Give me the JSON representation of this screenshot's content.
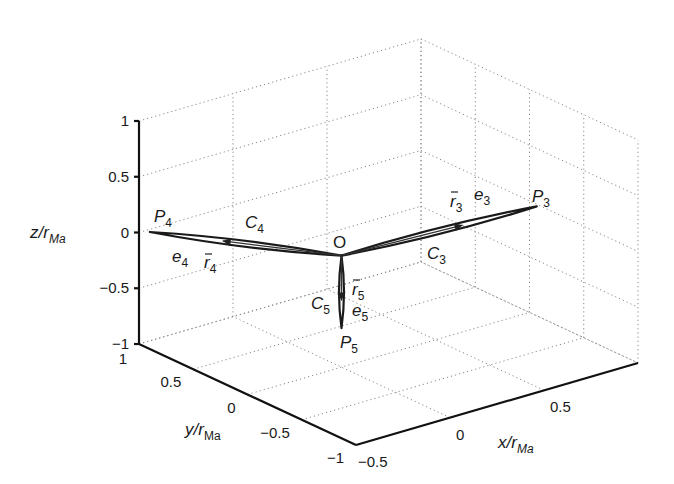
{
  "chart_data": {
    "type": "line3d",
    "title": "",
    "xlabel": "x/r_Ma",
    "ylabel": "y/r_Ma",
    "zlabel": "z/r_Ma",
    "xlim": [
      -0.5,
      1
    ],
    "ylim": [
      -1,
      1
    ],
    "zlim": [
      -1,
      1
    ],
    "xticks": [
      -0.5,
      0,
      0.5
    ],
    "yticks": [
      -1,
      -0.5,
      0,
      0.5,
      1
    ],
    "zticks": [
      -1,
      -0.5,
      0,
      0.5,
      1
    ],
    "xtick_labels": [
      "−0.5",
      "0",
      "0.5"
    ],
    "ytick_labels": [
      "−1",
      "−0.5",
      "0",
      "0.5",
      "1"
    ],
    "ztick_labels": [
      "−1",
      "−0.5",
      "0",
      "0.5",
      "1"
    ],
    "grid": true,
    "origin": {
      "label": "O",
      "x": 0,
      "y": 0,
      "z": 0
    },
    "series": [
      {
        "name": "C3",
        "curve_label": "C3",
        "end_label": "P3",
        "vector_label": "r3",
        "unit_label": "e3",
        "end": {
          "x": 0.75,
          "y": -0.5,
          "z": 0.3
        }
      },
      {
        "name": "C4",
        "curve_label": "C4",
        "end_label": "P4",
        "vector_label": "r4",
        "unit_label": "e4",
        "end": {
          "x": -0.5,
          "y": 0.9,
          "z": 0.05
        }
      },
      {
        "name": "C5",
        "curve_label": "C5",
        "end_label": "P5",
        "vector_label": "r5",
        "unit_label": "e5",
        "end": {
          "x": 0,
          "y": 0,
          "z": -0.65
        }
      }
    ]
  },
  "labels": {
    "z_axis": {
      "main": "z/r",
      "sub": "Ma"
    },
    "y_axis": {
      "main": "y/r",
      "sub": "Ma"
    },
    "x_axis": {
      "main": "x/r",
      "sub": "Ma"
    },
    "origin": "O",
    "P3": {
      "main": "P",
      "sub": "3"
    },
    "P4": {
      "main": "P",
      "sub": "4"
    },
    "P5": {
      "main": "P",
      "sub": "5"
    },
    "C3": {
      "main": "C",
      "sub": "3"
    },
    "C4": {
      "main": "C",
      "sub": "4"
    },
    "C5": {
      "main": "C",
      "sub": "5"
    },
    "r3": {
      "main": "r",
      "sub": "3"
    },
    "r4": {
      "main": "r",
      "sub": "4"
    },
    "r5": {
      "main": "r",
      "sub": "5"
    },
    "e3": {
      "main": "e",
      "sub": "3"
    },
    "e4": {
      "main": "e",
      "sub": "4"
    },
    "e5": {
      "main": "e",
      "sub": "5"
    }
  }
}
